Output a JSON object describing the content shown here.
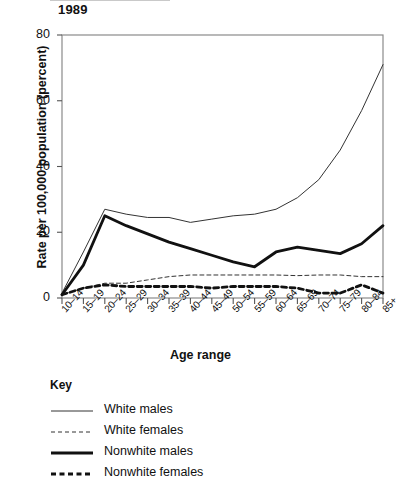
{
  "chart_data": {
    "type": "line",
    "title": "1989",
    "xlabel": "Age range",
    "ylabel": "Rate per 100,000 population (percent)",
    "ylim": [
      0,
      80
    ],
    "yticks": [
      0,
      20,
      40,
      60,
      80
    ],
    "grid": false,
    "legend_position": "below-left",
    "legend_title": "Key",
    "categories": [
      "10–14",
      "15–19",
      "20–24",
      "25–29",
      "30–34",
      "35–39",
      "40–44",
      "45–49",
      "50–54",
      "55–59",
      "60–64",
      "65–69",
      "70–74",
      "75–79",
      "80–84",
      "85+"
    ],
    "series": [
      {
        "name": "White males",
        "style": "solid-thin",
        "color": "#333333",
        "values": [
          1.5,
          14.0,
          27.0,
          25.5,
          24.5,
          24.5,
          23.0,
          24.0,
          25.0,
          25.5,
          27.0,
          30.5,
          36.0,
          45.0,
          57.0,
          71.0
        ]
      },
      {
        "name": "White females",
        "style": "dashed-thin",
        "color": "#333333",
        "values": [
          1.0,
          3.0,
          4.5,
          4.5,
          5.5,
          6.5,
          7.0,
          7.0,
          7.0,
          7.0,
          7.0,
          6.8,
          7.0,
          7.0,
          6.5,
          6.5
        ]
      },
      {
        "name": "Nonwhite males",
        "style": "solid-thick",
        "color": "#111111",
        "values": [
          1.0,
          10.0,
          25.0,
          22.0,
          19.5,
          17.0,
          15.0,
          13.0,
          11.0,
          9.5,
          14.0,
          15.5,
          14.5,
          13.5,
          16.5,
          22.0
        ]
      },
      {
        "name": "Nonwhite females",
        "style": "dashed-thick",
        "color": "#111111",
        "values": [
          1.0,
          3.0,
          4.0,
          3.5,
          3.5,
          3.5,
          3.5,
          3.0,
          3.5,
          3.5,
          3.5,
          3.0,
          1.5,
          1.5,
          4.0,
          1.5
        ]
      }
    ]
  }
}
